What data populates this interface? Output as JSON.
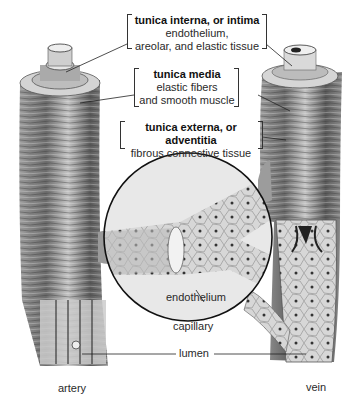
{
  "diagram": {
    "labels": {
      "tunica_interna": {
        "title": "tunica interna, or intima",
        "line1": "endothelium,",
        "line2": "areolar, and elastic tissue"
      },
      "tunica_media": {
        "title": "tunica media",
        "line1": "elastic fibers",
        "line2": "and smooth muscle"
      },
      "tunica_externa": {
        "title": "tunica externa, or adventitia",
        "line1": "fibrous connective tissue"
      },
      "endothelium": "endothelium",
      "capillary": "capillary",
      "lumen": "lumen",
      "artery": "artery",
      "vein": "vein"
    },
    "colors": {
      "ink": "#1a1a1a",
      "vessel_dark": "#4a4a4a",
      "vessel_mid": "#8a8a8a",
      "vessel_light": "#c8c8c8",
      "background": "#ffffff"
    }
  }
}
